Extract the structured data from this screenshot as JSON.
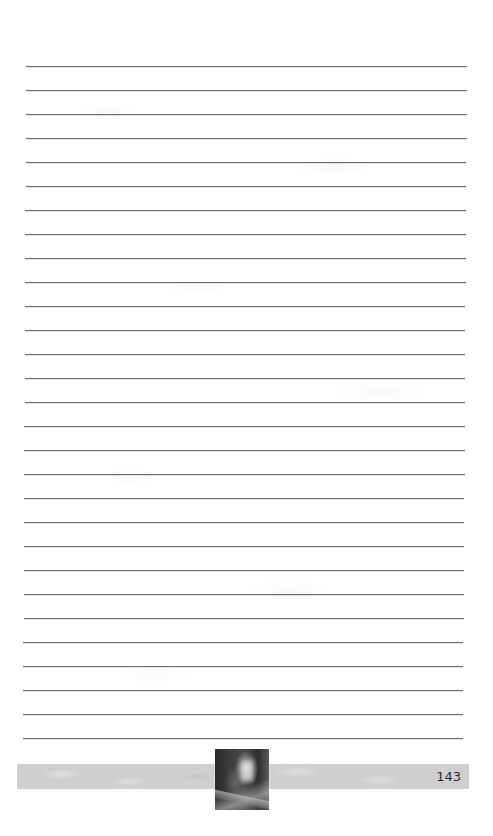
{
  "page": {
    "type": "blank lined notes page",
    "background_color": "#ffffff",
    "line_color": "#6b6b6b"
  },
  "ruled_lines": {
    "count": 29,
    "first_y": 66,
    "spacing": 24,
    "x_start_top": 26,
    "x_end_top": 467,
    "x_start_bottom": 23,
    "x_end_bottom": 463
  },
  "footer": {
    "band_color": "#cfcfcf",
    "page_number": "143",
    "thumbnail": {
      "description": "dark blurred photograph",
      "icon": "photo-thumbnail"
    }
  }
}
